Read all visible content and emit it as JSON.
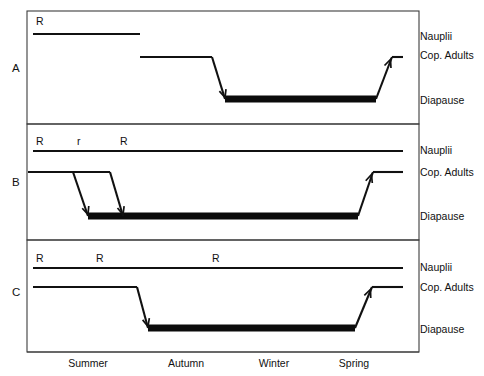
{
  "figure": {
    "background_color": "#ffffff",
    "line_color": "#111111",
    "frame_color": "#3c3c3c"
  },
  "stage_labels": {
    "nauplii": "Nauplii",
    "cop_adults": "Cop. Adults",
    "diapause": "Diapause"
  },
  "season_axis": {
    "seasons": [
      {
        "label": "Summer",
        "x": 88
      },
      {
        "label": "Autumn",
        "x": 186
      },
      {
        "label": "Winter",
        "x": 274
      },
      {
        "label": "Spring",
        "x": 354
      }
    ]
  },
  "panels": [
    {
      "letter": "A",
      "letter_x": 12,
      "letter_y": 72,
      "frame": {
        "x": 27,
        "y": 11,
        "width": 392,
        "height": 113
      },
      "nauplii_label_y": 40,
      "cop_adults_label_y": 59,
      "diapause_label_y": 104,
      "nauplii_line": {
        "y": 34,
        "x1": 33,
        "x2": 140
      },
      "cop_adults_line": {
        "y": 57,
        "x1": 140,
        "x2": 212
      },
      "diapause_bar": {
        "y": 99,
        "x1": 225,
        "x2": 376
      },
      "descents": [
        {
          "x1": 212,
          "y1": 57,
          "x2": 225,
          "y2": 99,
          "arrow": true
        }
      ],
      "ascents": [
        {
          "x1": 376,
          "y1": 99,
          "x2": 392,
          "y2": 57,
          "arrow": true,
          "tail_x2": 403
        }
      ],
      "recruitment_marks": [
        {
          "label": "R",
          "x": 36,
          "y": 25
        }
      ]
    },
    {
      "letter": "B",
      "letter_x": 12,
      "letter_y": 186,
      "frame": {
        "x": 27,
        "y": 124,
        "width": 392,
        "height": 116
      },
      "nauplii_label_y": 154,
      "cop_adults_label_y": 176,
      "diapause_label_y": 220,
      "nauplii_line": {
        "y": 151,
        "x1": 33,
        "x2": 403
      },
      "cop_adults_line": {
        "y": 172,
        "x1": 28,
        "x2": 110
      },
      "diapause_bar": {
        "y": 216,
        "x1": 88,
        "x2": 358
      },
      "descents": [
        {
          "x1": 73,
          "y1": 172,
          "x2": 88,
          "y2": 216,
          "arrow": true
        },
        {
          "x1": 110,
          "y1": 172,
          "x2": 123,
          "y2": 216,
          "arrow": true
        }
      ],
      "ascents": [
        {
          "x1": 358,
          "y1": 216,
          "x2": 373,
          "y2": 172,
          "arrow": true,
          "tail_x2": 403
        }
      ],
      "recruitment_marks": [
        {
          "label": "R",
          "x": 36,
          "y": 145
        },
        {
          "label": "r",
          "x": 77,
          "y": 145
        },
        {
          "label": "R",
          "x": 120,
          "y": 145
        }
      ]
    },
    {
      "letter": "C",
      "letter_x": 12,
      "letter_y": 296,
      "frame": {
        "x": 27,
        "y": 240,
        "width": 392,
        "height": 112
      },
      "nauplii_label_y": 271,
      "cop_adults_label_y": 291,
      "diapause_label_y": 333,
      "nauplii_line": {
        "y": 268,
        "x1": 33,
        "x2": 403
      },
      "cop_adults_line": {
        "y": 287,
        "x1": 33,
        "x2": 137
      },
      "diapause_bar": {
        "y": 328,
        "x1": 148,
        "x2": 355
      },
      "descents": [
        {
          "x1": 137,
          "y1": 287,
          "x2": 148,
          "y2": 328,
          "arrow": true
        }
      ],
      "ascents": [
        {
          "x1": 355,
          "y1": 328,
          "x2": 372,
          "y2": 287,
          "arrow": true,
          "tail_x2": 403
        }
      ],
      "recruitment_marks": [
        {
          "label": "R",
          "x": 36,
          "y": 262
        },
        {
          "label": "R",
          "x": 96,
          "y": 262
        },
        {
          "label": "R",
          "x": 212,
          "y": 262
        }
      ]
    }
  ],
  "label_x": 420,
  "axis": {
    "baseline_y": 352,
    "baseline_x1": 27,
    "baseline_x2": 419,
    "tick_y": 356,
    "season_label_y": 367
  }
}
